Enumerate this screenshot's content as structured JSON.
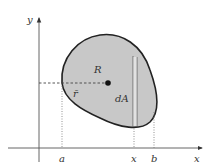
{
  "diagram": {
    "axes": {
      "x_label": "x",
      "y_label": "y"
    },
    "region": {
      "label": "R",
      "fill": "#c8c8c8",
      "stroke": "#222222"
    },
    "centroid": {
      "vector_label": "r̄"
    },
    "strip": {
      "label": "dA"
    },
    "x_ticks": [
      {
        "label": "a"
      },
      {
        "label": "x"
      },
      {
        "label": "b"
      }
    ],
    "colors": {
      "axis": "#555555",
      "guide": "#777777",
      "text": "#333333"
    }
  }
}
